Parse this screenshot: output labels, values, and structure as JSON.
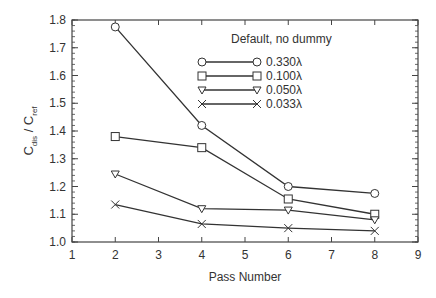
{
  "chart_data": {
    "type": "line",
    "title": "",
    "xlabel": "Pass Number",
    "ylabel": "C_dis / C_ref",
    "ylabel_main1": "C",
    "ylabel_sub1": "dis",
    "ylabel_sep": " / C",
    "ylabel_sub2": "ref",
    "xlim": [
      1,
      9
    ],
    "ylim": [
      1.0,
      1.8
    ],
    "x_ticks": [
      1,
      2,
      3,
      4,
      5,
      6,
      7,
      8,
      9
    ],
    "y_ticks": [
      1.0,
      1.1,
      1.2,
      1.3,
      1.4,
      1.5,
      1.6,
      1.7,
      1.8
    ],
    "x_tick_labels": [
      "1",
      "2",
      "3",
      "4",
      "5",
      "6",
      "7",
      "8",
      "9"
    ],
    "y_tick_labels": [
      "1.0",
      "1.1",
      "1.2",
      "1.3",
      "1.4",
      "1.5",
      "1.6",
      "1.7",
      "1.8"
    ],
    "grid": false,
    "legend_title": "Default, no dummy",
    "legend_position": "upper right (inside)",
    "x": [
      2,
      4,
      6,
      8
    ],
    "series": [
      {
        "name": "0.330λ",
        "marker": "circle",
        "values": [
          1.775,
          1.42,
          1.2,
          1.175
        ]
      },
      {
        "name": "0.100λ",
        "marker": "square",
        "values": [
          1.38,
          1.34,
          1.155,
          1.1
        ]
      },
      {
        "name": "0.050λ",
        "marker": "triangle-down",
        "values": [
          1.245,
          1.12,
          1.115,
          1.08
        ]
      },
      {
        "name": "0.033λ",
        "marker": "x",
        "values": [
          1.135,
          1.065,
          1.05,
          1.04
        ]
      }
    ],
    "colors": {
      "line": "#333333",
      "axis": "#444444",
      "background": "#ffffff"
    }
  }
}
